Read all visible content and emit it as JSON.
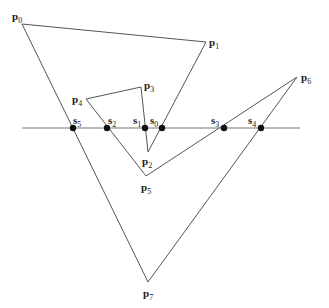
{
  "diagram": {
    "type": "polygon-sweep-line",
    "colors": {
      "edge": "#555555",
      "line": "#777777",
      "dot": "#111111",
      "text": "#222222"
    },
    "sweep_line": {
      "x1": 22,
      "x2": 300,
      "y": 128
    },
    "vertices": [
      {
        "id": "p0",
        "base": "p",
        "sub": "0",
        "x": 22,
        "y": 24,
        "lx": 12,
        "ly": 20
      },
      {
        "id": "p1",
        "base": "p",
        "sub": "1",
        "x": 206,
        "y": 42,
        "lx": 209,
        "ly": 46
      },
      {
        "id": "p2",
        "base": "p",
        "sub": "2",
        "x": 148,
        "y": 152,
        "lx": 142,
        "ly": 165
      },
      {
        "id": "p3",
        "base": "p",
        "sub": "3",
        "x": 141,
        "y": 87,
        "lx": 144,
        "ly": 89
      },
      {
        "id": "p4",
        "base": "p",
        "sub": "4",
        "x": 86,
        "y": 99,
        "lx": 72,
        "ly": 103
      },
      {
        "id": "p5",
        "base": "p",
        "sub": "5",
        "x": 146,
        "y": 176,
        "lx": 141,
        "ly": 191
      },
      {
        "id": "p6",
        "base": "p",
        "sub": "6",
        "x": 297,
        "y": 77,
        "lx": 301,
        "ly": 81
      },
      {
        "id": "p7",
        "base": "p",
        "sub": "7",
        "x": 148,
        "y": 282,
        "lx": 143,
        "ly": 297
      }
    ],
    "polygon_order": [
      "p0",
      "p1",
      "p2",
      "p3",
      "p4",
      "p5",
      "p6",
      "p7"
    ],
    "intersections": [
      {
        "id": "s0",
        "base": "s",
        "sub": "0",
        "x": 162,
        "y": 128,
        "lx": 150,
        "ly": 124
      },
      {
        "id": "s1",
        "base": "s",
        "sub": "1",
        "x": 145,
        "y": 128,
        "lx": 133,
        "ly": 124
      },
      {
        "id": "s2",
        "base": "s",
        "sub": "2",
        "x": 107,
        "y": 128,
        "lx": 108,
        "ly": 124
      },
      {
        "id": "s3",
        "base": "s",
        "sub": "3",
        "x": 224,
        "y": 128,
        "lx": 211,
        "ly": 124
      },
      {
        "id": "s4",
        "base": "s",
        "sub": "4",
        "x": 261,
        "y": 128,
        "lx": 248,
        "ly": 124
      },
      {
        "id": "s5",
        "base": "s",
        "sub": "5",
        "x": 73,
        "y": 128,
        "lx": 73,
        "ly": 124
      }
    ]
  }
}
